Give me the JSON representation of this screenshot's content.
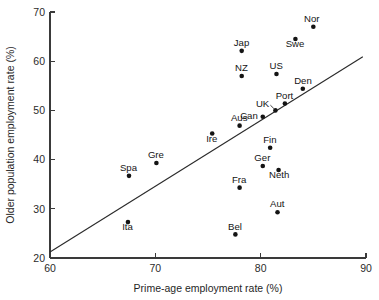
{
  "chart_data": {
    "type": "scatter",
    "title": "",
    "xlabel": "Prime-age employment rate (%)",
    "ylabel": "Older population employment rate (%)",
    "xlim": [
      60,
      90
    ],
    "ylim": [
      20,
      70
    ],
    "xticks": [
      60,
      70,
      80,
      90
    ],
    "yticks": [
      20,
      30,
      40,
      50,
      60,
      70
    ],
    "xtick_labels": [
      "60",
      "70",
      "80",
      "90"
    ],
    "ytick_labels": [
      "20",
      "30",
      "40",
      "50",
      "60",
      "70"
    ],
    "grid": false,
    "legend": false,
    "legend_position": "none",
    "points": [
      {
        "label": "Nor",
        "x": 85.0,
        "y": 67.0,
        "label_dx": -1.6,
        "label_dy": -4.8,
        "label_anchor": "middle"
      },
      {
        "label": "Swe",
        "x": 83.3,
        "y": 64.5,
        "label_dx": -0.4,
        "label_dy": 7.6,
        "label_anchor": "middle"
      },
      {
        "label": "Jap",
        "x": 78.2,
        "y": 62.1,
        "label_dx": -0.2,
        "label_dy": -4.8,
        "label_anchor": "middle"
      },
      {
        "label": "US",
        "x": 81.5,
        "y": 57.4,
        "label_dx": -0.2,
        "label_dy": -4.8,
        "label_anchor": "middle"
      },
      {
        "label": "NZ",
        "x": 78.2,
        "y": 57.0,
        "label_dx": -0.3,
        "label_dy": -4.8,
        "label_anchor": "middle"
      },
      {
        "label": "Den",
        "x": 84.0,
        "y": 54.4,
        "label_dx": 0.2,
        "label_dy": -4.8,
        "label_anchor": "middle"
      },
      {
        "label": "Port",
        "x": 82.3,
        "y": 51.4,
        "label_dx": -0.4,
        "label_dy": -4.8,
        "label_anchor": "middle"
      },
      {
        "label": "UK",
        "x": 81.4,
        "y": 50.0,
        "label_dx": -6.2,
        "label_dy": -3.4,
        "label_anchor": "end"
      },
      {
        "label": "Can",
        "x": 80.2,
        "y": 48.7,
        "label_dx": -5.0,
        "label_dy": 2.6,
        "label_anchor": "end"
      },
      {
        "label": "Aus",
        "x": 78.0,
        "y": 46.9,
        "label_dx": -0.4,
        "label_dy": -4.8,
        "label_anchor": "middle"
      },
      {
        "label": "Ire",
        "x": 75.4,
        "y": 45.3,
        "label_dx": -0.4,
        "label_dy": 8.2,
        "label_anchor": "middle"
      },
      {
        "label": "Fin",
        "x": 80.9,
        "y": 42.4,
        "label_dx": -0.3,
        "label_dy": -4.8,
        "label_anchor": "middle"
      },
      {
        "label": "Gre",
        "x": 70.1,
        "y": 39.3,
        "label_dx": -0.5,
        "label_dy": -4.8,
        "label_anchor": "middle"
      },
      {
        "label": "Ger",
        "x": 80.2,
        "y": 38.7,
        "label_dx": -0.4,
        "label_dy": -4.8,
        "label_anchor": "middle"
      },
      {
        "label": "Neth",
        "x": 81.7,
        "y": 37.9,
        "label_dx": 0.6,
        "label_dy": 8.4,
        "label_anchor": "middle"
      },
      {
        "label": "Spa",
        "x": 67.5,
        "y": 36.7,
        "label_dx": -0.5,
        "label_dy": -4.8,
        "label_anchor": "middle"
      },
      {
        "label": "Fra",
        "x": 78.0,
        "y": 34.3,
        "label_dx": -0.5,
        "label_dy": -4.8,
        "label_anchor": "middle"
      },
      {
        "label": "Aut",
        "x": 81.6,
        "y": 29.3,
        "label_dx": -0.3,
        "label_dy": -4.8,
        "label_anchor": "middle"
      },
      {
        "label": "Ita",
        "x": 67.4,
        "y": 27.3,
        "label_dx": -0.4,
        "label_dy": 8.4,
        "label_anchor": "middle"
      },
      {
        "label": "Bel",
        "x": 77.6,
        "y": 24.8,
        "label_dx": -0.4,
        "label_dy": -4.8,
        "label_anchor": "middle"
      }
    ],
    "trend_line": {
      "x_start": 60.0,
      "y_start": 21.2,
      "x_end": 89.7,
      "y_end": 60.9
    }
  },
  "colors": {
    "axis": "#3a3a3a",
    "marker": "#141414",
    "trend": "#2b2b2b",
    "text": "#1f1f1f",
    "background": "#ffffff"
  }
}
